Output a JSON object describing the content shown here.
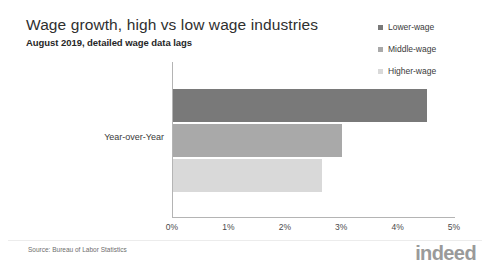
{
  "header": {
    "title": "Wage growth, high vs low wage industries",
    "subtitle": "August 2019, detailed wage data lags"
  },
  "footer": {
    "source": "Source: Bureau of Labor Statistics",
    "logo": "indeed"
  },
  "colors": {
    "lower_wage": "#797979",
    "middle_wage": "#a9a9a9",
    "higher_wage": "#d9d9d9",
    "axis": "#b4b4b4",
    "title": "#2f2f2f",
    "logo": "#9a9a9a"
  },
  "chart_data": {
    "type": "bar",
    "orientation": "horizontal",
    "title": "Wage growth, high vs low wage industries",
    "subtitle": "August 2019, detailed wage data lags",
    "categories": [
      "Year-over-Year"
    ],
    "series": [
      {
        "name": "Lower-wage",
        "values": [
          4.5
        ],
        "color": "#797979"
      },
      {
        "name": "Middle-wage",
        "values": [
          3.0
        ],
        "color": "#a9a9a9"
      },
      {
        "name": "Higher-wage",
        "values": [
          2.65
        ],
        "color": "#d9d9d9"
      }
    ],
    "xlabel": "",
    "ylabel": "",
    "xlim": [
      0,
      5
    ],
    "xticks": [
      0,
      1,
      2,
      3,
      4,
      5
    ],
    "xtick_labels": [
      "0%",
      "1%",
      "2%",
      "3%",
      "4%",
      "5%"
    ],
    "grid": false,
    "legend_position": "top-right",
    "legend_entries": [
      "Lower-wage",
      "Middle-wage",
      "Higher-wage"
    ]
  }
}
